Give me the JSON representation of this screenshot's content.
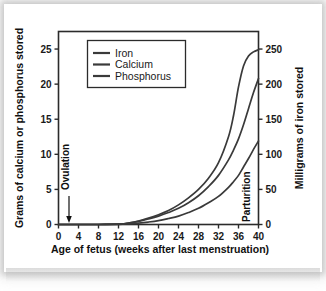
{
  "chart_data": {
    "type": "line",
    "title": "",
    "xlabel": "Age of fetus (weeks after last menstruation)",
    "ylabel": "Grams of calcium or phosphorus stored",
    "y2label": "Milligrams of iron stored",
    "xlim": [
      0,
      40
    ],
    "ylim": [
      0,
      27.5
    ],
    "y2lim": [
      0,
      275
    ],
    "grid": false,
    "legend_position": "top-left-inside",
    "x_ticks": [
      0,
      4,
      8,
      12,
      16,
      20,
      24,
      28,
      32,
      36,
      40
    ],
    "x_tick_labels": [
      "0",
      "4",
      "8",
      "12",
      "16",
      "20",
      "24",
      "28",
      "32",
      "36",
      "40"
    ],
    "y_ticks": [
      0,
      5,
      10,
      15,
      20,
      25
    ],
    "y_tick_labels": [
      "0",
      "5",
      "10",
      "15",
      "20",
      "25"
    ],
    "y2_ticks": [
      0,
      50,
      100,
      150,
      200,
      250
    ],
    "y2_tick_labels": [
      "0",
      "50",
      "100",
      "150",
      "200",
      "250"
    ],
    "x": [
      0,
      4,
      8,
      12,
      13,
      14,
      16,
      18,
      20,
      22,
      24,
      26,
      28,
      30,
      32,
      34,
      35,
      36,
      37,
      38,
      39,
      40
    ],
    "series": [
      {
        "name": "Iron",
        "axis": "right",
        "unit": "mg",
        "color": "#3a3a3a",
        "values": [
          0,
          0,
          0,
          0.5,
          1,
          2,
          5,
          9,
          14,
          20,
          28,
          38,
          50,
          66,
          88,
          125,
          155,
          196,
          226,
          240,
          246,
          249
        ]
      },
      {
        "name": "Calcium",
        "axis": "left",
        "unit": "g",
        "color": "#3a3a3a",
        "values": [
          0,
          0,
          0,
          0.05,
          0.1,
          0.2,
          0.45,
          0.8,
          1.2,
          1.7,
          2.3,
          3.1,
          4.1,
          5.4,
          7.0,
          9.2,
          10.6,
          12.2,
          14.2,
          16.5,
          18.8,
          20.8
        ]
      },
      {
        "name": "Phosphorus",
        "axis": "left",
        "unit": "g",
        "color": "#3a3a3a",
        "values": [
          0,
          0,
          0,
          0.02,
          0.05,
          0.1,
          0.2,
          0.35,
          0.55,
          0.85,
          1.2,
          1.7,
          2.3,
          3.1,
          4.0,
          5.3,
          6.1,
          7.0,
          8.2,
          9.4,
          10.7,
          11.9
        ]
      }
    ],
    "annotations": [
      {
        "text": "Ovulation",
        "x": 2,
        "orientation": "vertical",
        "arrow": "down"
      },
      {
        "text": "Parturition",
        "x": 39,
        "orientation": "vertical",
        "arrow": "none"
      }
    ]
  },
  "legend": {
    "items": [
      {
        "label": "Iron"
      },
      {
        "label": "Calcium"
      },
      {
        "label": "Phosphorus"
      }
    ]
  },
  "colors": {
    "line": "#3a3a3a",
    "frame": "#2b2b2b",
    "text": "#111111",
    "background": "#ffffff"
  }
}
